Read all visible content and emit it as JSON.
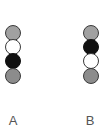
{
  "columns": [
    {
      "label": "A",
      "beads": [
        {
          "type": "dotted"
        },
        {
          "type": "white"
        },
        {
          "type": "black"
        },
        {
          "type": "gray"
        }
      ]
    },
    {
      "label": "B",
      "beads": [
        {
          "type": "dotted"
        },
        {
          "type": "black"
        },
        {
          "type": "white"
        },
        {
          "type": "gray"
        }
      ]
    }
  ],
  "colors": {
    "dotted": "#b5b5b5",
    "white": "#ffffff",
    "black": "#111111",
    "gray": "#8c8c8c",
    "outline": "#3a3a3a"
  }
}
